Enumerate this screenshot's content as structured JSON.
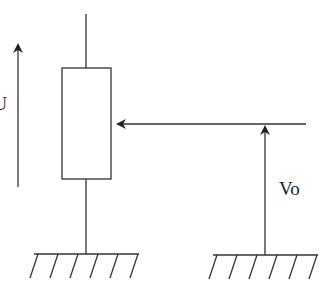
{
  "diagram": {
    "type": "potentiometer-circuit",
    "stroke_color": "#333333",
    "background": "#ffffff",
    "labels": {
      "input_voltage": "U",
      "output_voltage": "Vo"
    },
    "components": [
      {
        "name": "potentiometer",
        "kind": "resistor",
        "x": 62,
        "y": 68,
        "width": 49,
        "height": 111
      },
      {
        "name": "wiper",
        "kind": "arrow",
        "from": [
          306,
          124
        ],
        "to": [
          116,
          124
        ]
      },
      {
        "name": "input-voltage-arrow",
        "kind": "arrow",
        "from": [
          18,
          187
        ],
        "to": [
          18,
          43
        ]
      },
      {
        "name": "output-voltage-arrow",
        "kind": "arrow",
        "from": [
          265,
          254
        ],
        "to": [
          265,
          125
        ]
      },
      {
        "name": "left-ground",
        "kind": "ground",
        "x1": 34,
        "x2": 139,
        "y": 254,
        "hatches": 6
      },
      {
        "name": "right-ground",
        "kind": "ground",
        "x1": 213,
        "x2": 318,
        "y": 255,
        "hatches": 6
      }
    ]
  }
}
